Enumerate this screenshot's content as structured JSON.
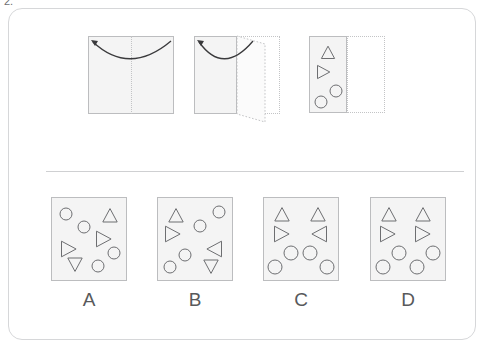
{
  "question": {
    "number": "2.",
    "type": "paper-folding-punch",
    "prompt_implied": "Which option shows the unfolded paper?"
  },
  "colors": {
    "card_border": "#d6d7d9",
    "sheet_fill": "#f4f4f4",
    "sheet_border": "#bcbdbf",
    "ghost_border": "#c3c4c6",
    "shape_stroke": "#6d6e71",
    "divider": "#cfd0d2",
    "text": "#58595b"
  },
  "sequence": {
    "steps": [
      {
        "name": "step-1-flat-sheet",
        "label": "",
        "sheet": {
          "x": 88,
          "y": 36,
          "w": 86,
          "h": 78
        },
        "fold_line": {
          "x": 131,
          "y": 36,
          "h": 78,
          "style": "dotted-vertical"
        },
        "arrow": {
          "type": "curved-fold-arrow",
          "direction": "right-to-left",
          "head": "left"
        },
        "ghost": null,
        "shapes": []
      },
      {
        "name": "step-2-folded-once",
        "label": "",
        "sheet": {
          "x": 194,
          "y": 36,
          "w": 43,
          "h": 78
        },
        "fold_line": null,
        "arrow": {
          "type": "curved-fold-arrow",
          "direction": "right-to-left",
          "head": "left"
        },
        "ghost": {
          "x": 237,
          "y": 36,
          "w": 43,
          "h": 78,
          "flap": true
        },
        "shapes": []
      },
      {
        "name": "step-3-punched",
        "label": "",
        "sheet": {
          "x": 309,
          "y": 36,
          "w": 38,
          "h": 77
        },
        "fold_line": null,
        "ghost": {
          "x": 347,
          "y": 36,
          "w": 38,
          "h": 77,
          "flap": false
        },
        "shapes": [
          {
            "type": "triangle-up",
            "cx": 19,
            "cy": 17,
            "size": 11
          },
          {
            "type": "triangle-right",
            "cx": 14,
            "cy": 36,
            "size": 11
          },
          {
            "type": "circle",
            "cx": 27,
            "cy": 55,
            "r": 6
          },
          {
            "type": "circle",
            "cx": 12,
            "cy": 66,
            "r": 6
          }
        ]
      }
    ]
  },
  "options": [
    {
      "id": "A",
      "label": "A",
      "name": "option-a",
      "box": {
        "x": 51,
        "y": 197,
        "w": 76,
        "h": 84
      },
      "shapes": [
        {
          "type": "circle",
          "cx": 15,
          "cy": 17,
          "r": 6
        },
        {
          "type": "triangle-up",
          "cx": 59,
          "cy": 19,
          "size": 12
        },
        {
          "type": "circle",
          "cx": 33,
          "cy": 30,
          "r": 6
        },
        {
          "type": "triangle-right",
          "cx": 52,
          "cy": 42,
          "size": 13
        },
        {
          "type": "triangle-right",
          "cx": 17,
          "cy": 52,
          "size": 13
        },
        {
          "type": "circle",
          "cx": 63,
          "cy": 56,
          "r": 6
        },
        {
          "type": "triangle-down",
          "cx": 24,
          "cy": 67,
          "size": 12
        },
        {
          "type": "circle",
          "cx": 47,
          "cy": 69,
          "r": 6
        }
      ]
    },
    {
      "id": "B",
      "label": "B",
      "name": "option-b",
      "box": {
        "x": 157,
        "y": 197,
        "w": 76,
        "h": 84
      },
      "shapes": [
        {
          "type": "circle",
          "cx": 62,
          "cy": 15,
          "r": 6
        },
        {
          "type": "triangle-up",
          "cx": 19,
          "cy": 19,
          "size": 12
        },
        {
          "type": "circle",
          "cx": 43,
          "cy": 29,
          "r": 6
        },
        {
          "type": "triangle-right",
          "cx": 15,
          "cy": 37,
          "size": 13
        },
        {
          "type": "triangle-left",
          "cx": 58,
          "cy": 52,
          "size": 13
        },
        {
          "type": "circle",
          "cx": 28,
          "cy": 58,
          "r": 6
        },
        {
          "type": "circle",
          "cx": 13,
          "cy": 70,
          "r": 6
        },
        {
          "type": "triangle-down",
          "cx": 54,
          "cy": 69,
          "size": 12
        }
      ]
    },
    {
      "id": "C",
      "label": "C",
      "name": "option-c",
      "box": {
        "x": 263,
        "y": 197,
        "w": 76,
        "h": 84
      },
      "shapes": [
        {
          "type": "triangle-up",
          "cx": 19,
          "cy": 18,
          "size": 12
        },
        {
          "type": "triangle-up",
          "cx": 55,
          "cy": 18,
          "size": 12
        },
        {
          "type": "triangle-right",
          "cx": 18,
          "cy": 37,
          "size": 13
        },
        {
          "type": "triangle-left",
          "cx": 57,
          "cy": 37,
          "size": 13
        },
        {
          "type": "circle",
          "cx": 28,
          "cy": 56,
          "r": 7
        },
        {
          "type": "circle",
          "cx": 47,
          "cy": 56,
          "r": 7
        },
        {
          "type": "circle",
          "cx": 12,
          "cy": 70,
          "r": 7
        },
        {
          "type": "circle",
          "cx": 64,
          "cy": 70,
          "r": 7
        }
      ]
    },
    {
      "id": "D",
      "label": "D",
      "name": "option-d",
      "box": {
        "x": 370,
        "y": 197,
        "w": 76,
        "h": 84
      },
      "shapes": [
        {
          "type": "triangle-up",
          "cx": 19,
          "cy": 18,
          "size": 12
        },
        {
          "type": "triangle-up",
          "cx": 53,
          "cy": 18,
          "size": 12
        },
        {
          "type": "triangle-right",
          "cx": 17,
          "cy": 37,
          "size": 13
        },
        {
          "type": "triangle-right",
          "cx": 52,
          "cy": 37,
          "size": 13
        },
        {
          "type": "circle",
          "cx": 29,
          "cy": 56,
          "r": 7
        },
        {
          "type": "circle",
          "cx": 63,
          "cy": 56,
          "r": 7
        },
        {
          "type": "circle",
          "cx": 13,
          "cy": 70,
          "r": 7
        },
        {
          "type": "circle",
          "cx": 47,
          "cy": 70,
          "r": 7
        }
      ]
    }
  ]
}
